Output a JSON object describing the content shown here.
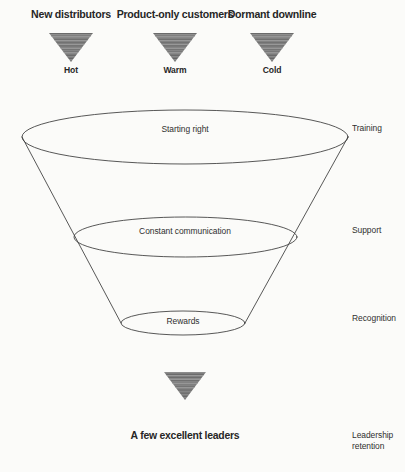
{
  "diagram": {
    "type": "funnel",
    "background_color": "#fbfbf9",
    "line_color": "#3a3a3a",
    "triangle_fill": "#7a7a7a",
    "text_color": "#262626"
  },
  "inputs": [
    {
      "id": "new-distributors",
      "heading": "New distributors",
      "temperature": "Hot",
      "icon": "down-triangle-icon",
      "center_x": 71
    },
    {
      "id": "product-only-customers",
      "heading": "Product-only customers",
      "temperature": "Warm",
      "icon": "down-triangle-icon",
      "center_x": 175
    },
    {
      "id": "dormant-downline",
      "heading": "Dormant downline",
      "temperature": "Cold",
      "icon": "down-triangle-icon",
      "center_x": 272
    }
  ],
  "stages": [
    {
      "id": "starting-right",
      "label": "Starting right",
      "side_label": "Training",
      "center_x": 185,
      "center_y": 130,
      "side_label_y": 129
    },
    {
      "id": "constant-communication",
      "label": "Constant communication",
      "side_label": "Support",
      "center_x": 185,
      "center_y": 232,
      "side_label_y": 231
    },
    {
      "id": "rewards",
      "label": "Rewards",
      "side_label": "Recognition",
      "center_x": 183,
      "center_y": 322,
      "side_label_y": 319
    }
  ],
  "outcome": {
    "id": "excellent-leaders",
    "icon": "down-triangle-icon",
    "label": "A few excellent leaders",
    "side_label_line1": "Leadership",
    "side_label_line2": "retention",
    "center_x": 185,
    "label_y": 436
  },
  "geometry": {
    "top_ellipse": {
      "cx": 185,
      "cy": 137,
      "rx": 163,
      "ry": 27
    },
    "mid_ellipse": {
      "cx": 185.5,
      "cy": 237,
      "rx": 111.5,
      "ry": 20
    },
    "bottom_ellipse": {
      "cx": 183,
      "cy": 323,
      "rx": 62,
      "ry": 12
    }
  }
}
